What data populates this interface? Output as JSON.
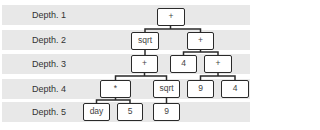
{
  "depth_labels": [
    "Depth. 1",
    "Depth. 2",
    "Depth. 3",
    "Depth. 4",
    "Depth. 5"
  ],
  "nodes": {
    "d1_root": "+",
    "d2_sqrt": "sqrt",
    "d2_plus": "+",
    "d3_plus_left": "+",
    "d3_four": "4",
    "d3_plus_right": "+",
    "d4_mult": "*",
    "d4_sqrt": "sqrt",
    "d4_nine": "9",
    "d4_four": "4",
    "d5_day": "day",
    "d5_five": "5",
    "d5_nine": "9"
  }
}
